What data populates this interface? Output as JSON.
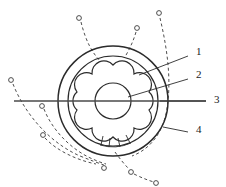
{
  "figure": {
    "kind": "technical-line-drawing",
    "background_color": "#ffffff",
    "line_color": "#2b2b2b",
    "dashed_color": "#3a3a3a",
    "axis_color": "#4a4a4a",
    "marker_fill": "#ffffff"
  },
  "callouts": [
    {
      "id": "callout-1",
      "label": "1",
      "label_x": 196,
      "label_y": 55,
      "leader_x1": 188,
      "leader_y1": 56,
      "leader_x2": 139,
      "leader_y2": 75
    },
    {
      "id": "callout-2",
      "label": "2",
      "label_x": 196,
      "label_y": 78,
      "leader_x1": 188,
      "leader_y1": 79,
      "leader_x2": 128,
      "leader_y2": 97
    },
    {
      "id": "callout-3",
      "label": "3",
      "label_x": 214,
      "label_y": 103,
      "leader_x1": 206,
      "leader_y1": 101,
      "leader_x2": 160,
      "leader_y2": 101
    },
    {
      "id": "callout-4",
      "label": "4",
      "label_x": 196,
      "label_y": 133,
      "leader_x1": 188,
      "leader_y1": 132,
      "leader_x2": 163,
      "leader_y2": 127
    }
  ],
  "geometry": {
    "center_x": 113,
    "center_y": 101,
    "outer_circle_r": 55,
    "inner_circle_r": 45,
    "hub_circle_r": 18,
    "lobe_count": 6,
    "lobe_outer_r": 36,
    "lobe_radius": 12,
    "axis_line": {
      "x1": 14,
      "y1": 101,
      "x2": 206,
      "y2": 101
    }
  },
  "trajectories": [
    {
      "id": "traj-top-left",
      "marker_x": 79,
      "marker_y": 18
    },
    {
      "id": "traj-top-mid",
      "marker_x": 137,
      "marker_y": 28
    },
    {
      "id": "traj-top-right",
      "marker_x": 159,
      "marker_y": 13
    },
    {
      "id": "traj-left-upper",
      "marker_x": 11,
      "marker_y": 80
    },
    {
      "id": "traj-left-axis",
      "marker_x": 42,
      "marker_y": 106
    },
    {
      "id": "traj-left-lower",
      "marker_x": 43,
      "marker_y": 135
    },
    {
      "id": "traj-bottom-a",
      "marker_x": 104,
      "marker_y": 168
    },
    {
      "id": "traj-bottom-b",
      "marker_x": 131,
      "marker_y": 172
    },
    {
      "id": "traj-bottom-c",
      "marker_x": 156,
      "marker_y": 183
    }
  ]
}
